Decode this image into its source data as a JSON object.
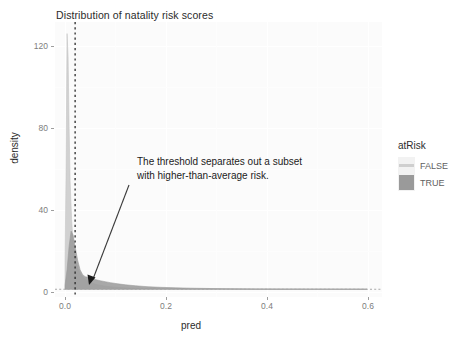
{
  "chart_data": {
    "type": "area",
    "title": "Distribution of natality risk scores",
    "xlabel": "pred",
    "ylabel": "density",
    "xlim": [
      -0.02,
      0.63
    ],
    "ylim": [
      -4,
      138
    ],
    "xticks": [
      "0.0",
      "0.2",
      "0.4",
      "0.6"
    ],
    "xtick_values": [
      0.0,
      0.2,
      0.4,
      0.6
    ],
    "yticks": [
      "0",
      "40",
      "80",
      "120"
    ],
    "ytick_values": [
      0,
      40,
      80,
      120
    ],
    "grid": true,
    "legend": {
      "title": "atRisk",
      "position": "right",
      "entries": [
        {
          "label": "FALSE",
          "color": "#cfcfcf"
        },
        {
          "label": "TRUE",
          "color": "#9a9a9a"
        }
      ]
    },
    "annotations": [
      {
        "text_lines": [
          "The threshold separates out a subset",
          "with higher-than-average risk."
        ],
        "arrow_from": {
          "x": 0.055,
          "y": 82
        },
        "arrow_to": {
          "x": 0.042,
          "y": 3
        }
      }
    ],
    "reference_lines": [
      {
        "orientation": "vertical",
        "value": 0.02,
        "style": "dotted",
        "color": "#2b2b2b"
      },
      {
        "orientation": "horizontal",
        "value": 0,
        "style": "dotted",
        "color": "#a8a8a8"
      }
    ],
    "series": [
      {
        "name": "FALSE",
        "color": "#cfcfcf",
        "x": [
          0.0,
          0.002,
          0.004,
          0.006,
          0.008,
          0.01,
          0.013,
          0.016,
          0.02,
          0.025,
          0.03,
          0.036,
          0.043,
          0.05,
          0.06,
          0.07,
          0.085,
          0.1,
          0.12,
          0.14,
          0.17,
          0.2,
          0.24,
          0.28,
          0.33,
          0.38,
          0.44,
          0.5,
          0.56,
          0.6
        ],
        "y": [
          14,
          62,
          132,
          120,
          84,
          56,
          36,
          24,
          16,
          11,
          8,
          6,
          4.6,
          3.6,
          2.6,
          2.0,
          1.4,
          1.0,
          0.7,
          0.5,
          0.33,
          0.22,
          0.14,
          0.09,
          0.05,
          0.03,
          0.02,
          0.01,
          0.005,
          0.0
        ]
      },
      {
        "name": "TRUE",
        "color": "#9a9a9a",
        "x": [
          0.0,
          0.004,
          0.008,
          0.012,
          0.016,
          0.02,
          0.025,
          0.03,
          0.035,
          0.04,
          0.045,
          0.05,
          0.06,
          0.07,
          0.08,
          0.09,
          0.105,
          0.12,
          0.14,
          0.165,
          0.19,
          0.22,
          0.25,
          0.29,
          0.33,
          0.38,
          0.43,
          0.48,
          0.53,
          0.58,
          0.6
        ],
        "y": [
          2,
          10,
          22,
          30,
          28,
          22,
          15,
          10,
          7.5,
          6.5,
          6.2,
          5.8,
          5.0,
          4.4,
          3.9,
          3.4,
          2.8,
          2.3,
          1.8,
          1.3,
          1.0,
          0.75,
          0.55,
          0.38,
          0.26,
          0.16,
          0.1,
          0.06,
          0.03,
          0.01,
          0.0
        ]
      }
    ]
  }
}
